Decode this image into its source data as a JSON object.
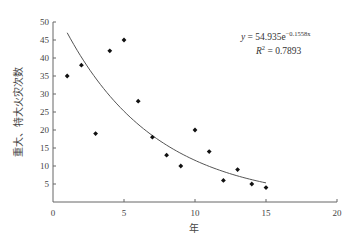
{
  "chart_data": {
    "type": "scatter",
    "title": "",
    "xlabel": "年",
    "ylabel": "重大、特大火灾次数",
    "xlim": [
      0,
      20
    ],
    "ylim": [
      0,
      50
    ],
    "xticks": [
      0,
      5,
      10,
      15,
      20
    ],
    "yticks": [
      5,
      10,
      15,
      20,
      25,
      30,
      35,
      40,
      45,
      50
    ],
    "grid": false,
    "legend": null,
    "series": [
      {
        "name": "火灾次数",
        "type": "scatter",
        "marker": "diamond",
        "color": "#111111",
        "x": [
          1,
          2,
          3,
          4,
          5,
          6,
          7,
          8,
          9,
          10,
          11,
          12,
          13,
          14,
          15
        ],
        "y": [
          35,
          38,
          19,
          42,
          45,
          28,
          18,
          13,
          10,
          20,
          14,
          6,
          9,
          5,
          4
        ]
      },
      {
        "name": "指数趋势线",
        "type": "line",
        "color": "#555555",
        "formula": {
          "a": 54.935,
          "b": -0.1558
        },
        "x_range": [
          1,
          15
        ]
      }
    ],
    "annotations": [
      {
        "text": "y = 54.935e^(-0.1558x)",
        "position": "top-right"
      },
      {
        "text": "R² = 0.7893",
        "position": "top-right"
      }
    ]
  },
  "equation": {
    "lhs": "y",
    "eq": " = 54.935e",
    "exponent": "−0.1558x",
    "r2_lhs": "R",
    "r2_sup": "2",
    "r2_value": " = 0.7893"
  }
}
